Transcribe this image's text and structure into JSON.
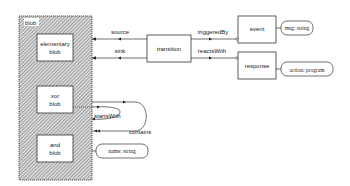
{
  "diagram": {
    "container": {
      "label": "blob"
    },
    "nodes": {
      "elementary_blob": {
        "line1": "elementary",
        "line2": "blob"
      },
      "xor_blob": {
        "line1": "xor",
        "line2": "blob"
      },
      "and_blob": {
        "line1": "and",
        "line2": "blob"
      },
      "transition": {
        "label": "transition"
      },
      "event": {
        "label": "event"
      },
      "response": {
        "label": "response"
      }
    },
    "attributes": {
      "event_attr": "msg: string",
      "response_attr": "action: program",
      "blob_attr": "name: string"
    },
    "edges": {
      "source": "source",
      "sink": "sink",
      "triggeredBy": "triggeredBy",
      "reactsWith": "reactsWith",
      "startsWith": "startsWith",
      "contains": "contains"
    }
  }
}
